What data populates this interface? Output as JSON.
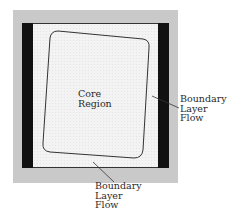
{
  "figure": {
    "type": "flow-region-schematic",
    "colors": {
      "outer_border": "#c9c9c9",
      "wall_bars": "#111111",
      "interior": "#f1f1f1",
      "core_outline": "#333333",
      "leader_lines": "#333333",
      "text": "#2a2a2a"
    },
    "core_region": {
      "lines": [
        "Core",
        "Region"
      ]
    },
    "right_callout": {
      "lines": [
        "Boundary",
        "Layer",
        "Flow"
      ]
    },
    "bottom_callout": {
      "lines": [
        "Boundary",
        "Layer",
        "Flow"
      ]
    }
  }
}
